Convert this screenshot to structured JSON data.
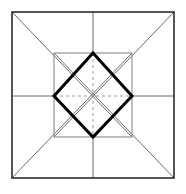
{
  "figure": {
    "canvas": {
      "width": 186,
      "height": 194,
      "background_color": "#ffffff"
    },
    "colors": {
      "outer_stroke": "#2b2b2b",
      "inner_stroke": "#8a8a8a",
      "diagonal_stroke": "#6b6b6b",
      "diamond_stroke": "#000000",
      "dashed_stroke": "#9a9a9a"
    },
    "stroke_widths": {
      "outer_square": 1.6,
      "inner_square": 1.1,
      "diagonals": 1.0,
      "diamond": 3.0,
      "dashed_axes": 1.0
    },
    "geometry": {
      "outer_square": {
        "name": "outer-square",
        "left": 12,
        "top": 12,
        "right": 174,
        "bottom": 178
      },
      "inner_square": {
        "name": "inner-square",
        "left": 54,
        "top": 53,
        "right": 132,
        "bottom": 137
      },
      "center": {
        "x": 93,
        "y": 96
      },
      "outer_corners": [
        {
          "name": "top-left",
          "x": 12,
          "y": 12
        },
        {
          "name": "top-right",
          "x": 174,
          "y": 12
        },
        {
          "name": "bottom-right",
          "x": 174,
          "y": 178
        },
        {
          "name": "bottom-left",
          "x": 12,
          "y": 178
        }
      ],
      "outer_edge_midpoints": [
        {
          "name": "top",
          "x": 93,
          "y": 12
        },
        {
          "name": "right",
          "x": 174,
          "y": 96
        },
        {
          "name": "bottom",
          "x": 93,
          "y": 178
        },
        {
          "name": "left",
          "x": 12,
          "y": 96
        }
      ],
      "inner_corners": [
        {
          "name": "top-left",
          "x": 54,
          "y": 53
        },
        {
          "name": "top-right",
          "x": 132,
          "y": 53
        },
        {
          "name": "bottom-right",
          "x": 132,
          "y": 137
        },
        {
          "name": "bottom-left",
          "x": 54,
          "y": 137
        }
      ],
      "diamond_vertices": [
        {
          "name": "top",
          "x": 93,
          "y": 53
        },
        {
          "name": "right",
          "x": 132,
          "y": 96
        },
        {
          "name": "bottom",
          "x": 93,
          "y": 137
        },
        {
          "name": "left",
          "x": 54,
          "y": 96
        }
      ],
      "diagonals": [
        {
          "name": "tl-to-br",
          "x1": 12,
          "y1": 12,
          "x2": 132,
          "y2": 137
        },
        {
          "name": "tr-to-bl",
          "x1": 174,
          "y1": 12,
          "x2": 54,
          "y2": 137
        },
        {
          "name": "br-to-tl",
          "x1": 174,
          "y1": 178,
          "x2": 54,
          "y2": 53
        },
        {
          "name": "bl-to-tr",
          "x1": 12,
          "y1": 178,
          "x2": 132,
          "y2": 53
        }
      ],
      "edge_spokes": [
        {
          "name": "top-spoke",
          "x1": 93,
          "y1": 12,
          "x2": 93,
          "y2": 53
        },
        {
          "name": "right-spoke",
          "x1": 174,
          "y1": 96,
          "x2": 132,
          "y2": 96
        },
        {
          "name": "bottom-spoke",
          "x1": 93,
          "y1": 178,
          "x2": 93,
          "y2": 137
        },
        {
          "name": "left-spoke",
          "x1": 12,
          "y1": 96,
          "x2": 54,
          "y2": 96
        }
      ],
      "dashed_axes": [
        {
          "name": "horizontal-axis",
          "x1": 54,
          "y1": 96,
          "x2": 132,
          "y2": 96
        },
        {
          "name": "vertical-axis",
          "x1": 93,
          "y1": 53,
          "x2": 93,
          "y2": 137
        }
      ],
      "dash_pattern": "3 3"
    }
  }
}
